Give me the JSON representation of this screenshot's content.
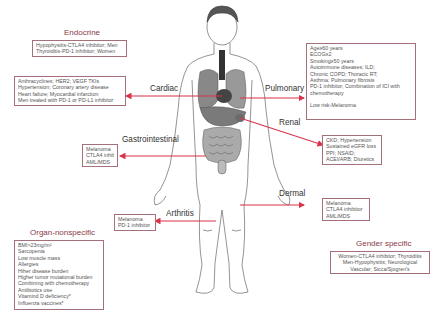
{
  "endocrine": {
    "title": "Endocrine",
    "lines": [
      "Hypophysitis-CTLA4 inhibitor; Men",
      "Thyroiditis-PD-1 inhibitor; Women"
    ]
  },
  "cardiac": {
    "label": "Cardiac",
    "lines": [
      "Anthracyclines; HER2; VEGF TKIs",
      "Hypertension; Coronary artery disease",
      "Heart failure; Myocardial infarction",
      "Men treated with PD-1 or PD-L1 inhibitor"
    ]
  },
  "gastrointestinal": {
    "label": "Gastrointestinal",
    "lines": [
      "Melanoma",
      "CTLA4 inhibitor",
      "AML/MDS"
    ]
  },
  "pulmonary": {
    "label": "Pulmonary",
    "lines": [
      "Age≥60 years",
      "ECOG≥2",
      "Smoking≥50 years",
      "Autoimmune diseases; ILD;",
      "Chronic COPD; Thoracic RT;",
      "Asthma; Pulmonary fibrosis",
      "PD-1 inhibitor; Combination of ICI with",
      "chemotherapy",
      "",
      "Low risk-Melanoma"
    ]
  },
  "renal": {
    "label": "Renal",
    "lines": [
      "CKD; Hypertension",
      "Sustained eGFR loss",
      "PPI; NSAID;",
      "ACEI/ARB; Diuretics"
    ]
  },
  "dermal": {
    "label": "Dermal",
    "lines": [
      "Melanoma",
      "CTLA4 inhibitor",
      "AML/MDS"
    ]
  },
  "arthritis": {
    "label": "Arthritis",
    "lines": [
      "Melanoma",
      "PD-1 inhibitor"
    ]
  },
  "organ_nonspecific": {
    "title": "Organ-nonspecific",
    "lines": [
      "BMI>23mg/m²",
      "Sarcopenia",
      "Low muscle mass",
      "Allergies",
      "Hiher disease burden",
      "Higher tumor mutational burden",
      "Combining with chemotherapy",
      "Antibiotics use",
      "Vitamind D deficiency*",
      "Influenza vaccines*"
    ]
  },
  "gender_specific": {
    "title": "Gender specific",
    "lines": [
      "Women-CTLA4 inhibitor; Thyroiditis",
      "Men-Hypophysitis; Neurological",
      "Vascular; Sicca/Sjogren's"
    ]
  },
  "colors": {
    "arrow": "#d8334a",
    "box_border": "#a4707a",
    "title": "#8a3a48",
    "outline": "#555555"
  }
}
